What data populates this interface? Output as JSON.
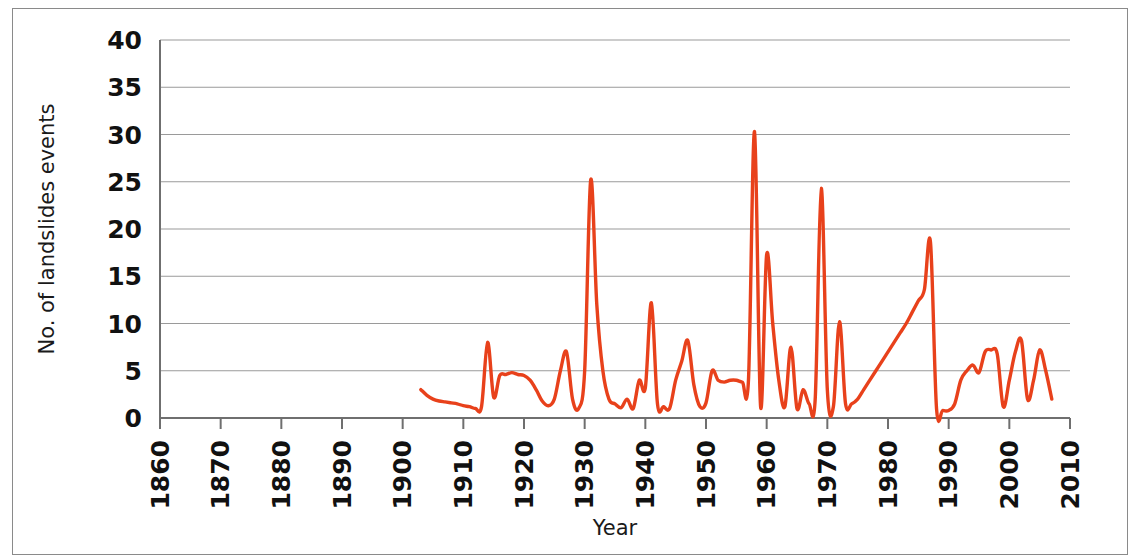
{
  "chart_data": {
    "type": "line",
    "title": "",
    "xlabel": "Year",
    "ylabel": "No. of landslides events",
    "xlim": [
      1860,
      2010
    ],
    "ylim": [
      0,
      40
    ],
    "grid": true,
    "legend": "none",
    "line_color": "#E8411B",
    "gridline_color": "#9a9a9a",
    "axis_color": "#7a7a7a",
    "x_ticks": [
      "1860",
      "1870",
      "1880",
      "1890",
      "1900",
      "1910",
      "1920",
      "1930",
      "1940",
      "1950",
      "1960",
      "1970",
      "1980",
      "1990",
      "2000",
      "2010"
    ],
    "y_ticks": [
      "0",
      "5",
      "10",
      "15",
      "20",
      "25",
      "30",
      "35",
      "40"
    ],
    "series": [
      {
        "name": "No. of landslides events",
        "x": [
          1903,
          1904,
          1905,
          1906,
          1907,
          1908,
          1909,
          1910,
          1911,
          1912,
          1913,
          1914,
          1915,
          1916,
          1917,
          1918,
          1919,
          1920,
          1921,
          1922,
          1923,
          1924,
          1925,
          1926,
          1927,
          1928,
          1929,
          1930,
          1931,
          1932,
          1933,
          1934,
          1935,
          1936,
          1937,
          1938,
          1939,
          1940,
          1941,
          1942,
          1943,
          1944,
          1945,
          1946,
          1947,
          1948,
          1949,
          1950,
          1951,
          1952,
          1953,
          1954,
          1955,
          1956,
          1957,
          1958,
          1959,
          1960,
          1961,
          1962,
          1963,
          1964,
          1965,
          1966,
          1967,
          1968,
          1969,
          1970,
          1971,
          1972,
          1973,
          1974,
          1975,
          1976,
          1977,
          1978,
          1979,
          1980,
          1981,
          1982,
          1983,
          1984,
          1985,
          1986,
          1987,
          1988,
          1989,
          1990,
          1991,
          1992,
          1993,
          1994,
          1995,
          1996,
          1997,
          1998,
          1999,
          2000,
          2001,
          2002,
          2003,
          2004,
          2005,
          2006,
          2007
        ],
        "y": [
          3.0,
          2.4,
          2.0,
          1.8,
          1.7,
          1.6,
          1.5,
          1.3,
          1.2,
          1.0,
          1.2,
          8.0,
          2.2,
          4.5,
          4.6,
          4.8,
          4.6,
          4.5,
          4.0,
          3.0,
          1.8,
          1.3,
          2.0,
          5.0,
          7.0,
          2.0,
          1.0,
          5.0,
          25.2,
          12.0,
          5.0,
          2.0,
          1.5,
          1.1,
          2.0,
          1.0,
          4.0,
          3.2,
          12.2,
          1.5,
          1.2,
          1.0,
          4.0,
          6.0,
          8.2,
          3.5,
          1.2,
          1.6,
          5.0,
          4.0,
          3.8,
          4.0,
          4.0,
          3.8,
          4.0,
          30.3,
          1.2,
          17.3,
          10.0,
          4.0,
          1.2,
          7.5,
          1.0,
          3.0,
          1.5,
          2.0,
          24.3,
          3.0,
          1.2,
          10.2,
          1.5,
          1.5,
          2.0,
          3.0,
          4.0,
          5.0,
          6.0,
          7.0,
          8.0,
          9.0,
          10.0,
          11.2,
          12.4,
          13.6,
          18.6,
          1.0,
          0.8,
          0.8,
          1.5,
          4.0,
          5.0,
          5.6,
          4.8,
          7.0,
          7.2,
          6.8,
          1.2,
          4.0,
          7.0,
          8.2,
          2.0,
          4.0,
          7.2,
          5.0,
          2.0
        ]
      }
    ]
  }
}
